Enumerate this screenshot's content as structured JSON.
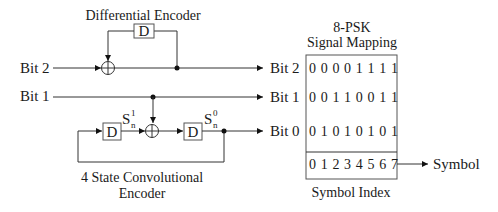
{
  "differential_encoder": {
    "title": "Differential Encoder",
    "delay_label": "D"
  },
  "inputs": {
    "bit2": "Bit 2",
    "bit1": "Bit 1"
  },
  "convolutional_encoder": {
    "title_line1": "4 State Convolutional",
    "title_line2": "Encoder",
    "delay1_label": "D",
    "delay2_label": "D",
    "state1": {
      "base": "S",
      "sup": "1",
      "sub": "n"
    },
    "state0": {
      "base": "S",
      "sup": "0",
      "sub": "n"
    }
  },
  "mapping": {
    "title_line1": "8-PSK",
    "title_line2": "Signal Mapping",
    "rows": [
      {
        "label": "Bit 2",
        "bits": "0 0 0 0 1 1 1 1"
      },
      {
        "label": "Bit 1",
        "bits": "0 0 1 1 0 0 1 1"
      },
      {
        "label": "Bit 0",
        "bits": "0 1 0 1 0 1 0 1"
      }
    ],
    "symbol_index_row": "0 1 2 3 4 5 6 7",
    "symbol_index_caption": "Symbol Index",
    "output_label": "Symbol"
  }
}
